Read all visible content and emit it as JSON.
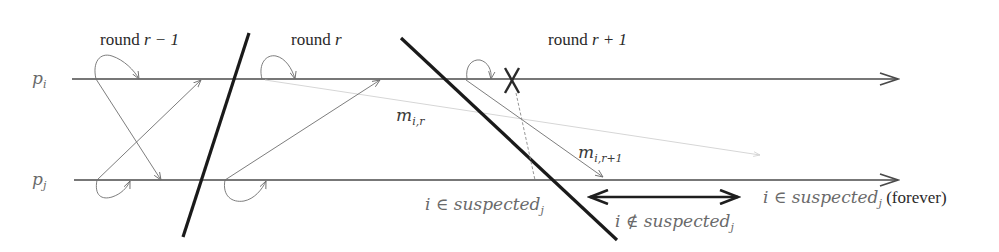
{
  "diagram": {
    "rounds": [
      {
        "label_prefix": "round ",
        "label_var": "r − 1",
        "x": 100,
        "y": 45
      },
      {
        "label_prefix": "round ",
        "label_var": "r",
        "x": 291,
        "y": 45
      },
      {
        "label_prefix": "round ",
        "label_var": "r + 1",
        "x": 548,
        "y": 45
      }
    ],
    "processes": [
      {
        "id": "pi",
        "label_base": "p",
        "label_sub": "i",
        "y": 79
      },
      {
        "id": "pj",
        "label_base": "p",
        "label_sub": "j",
        "y": 180
      }
    ],
    "messages": [
      {
        "id": "m_i_r",
        "label_base": "m",
        "label_sub": "i,r",
        "style": "faint"
      },
      {
        "id": "m_i_r1",
        "label_base": "m",
        "label_sub": "i,r+1",
        "style": "normal"
      }
    ],
    "annotations": {
      "suspected_before": {
        "prefix": "i ∈ ",
        "word": "suspected",
        "sub": "j"
      },
      "not_suspected": {
        "prefix": "i ∉ ",
        "word": "suspected",
        "sub": "j"
      },
      "suspected_forever": {
        "prefix": "i ∈ ",
        "word": "suspected",
        "sub": "j",
        "suffix": " (forever)"
      }
    },
    "events": {
      "crash_marker": "X",
      "crash_process": "pi"
    }
  }
}
